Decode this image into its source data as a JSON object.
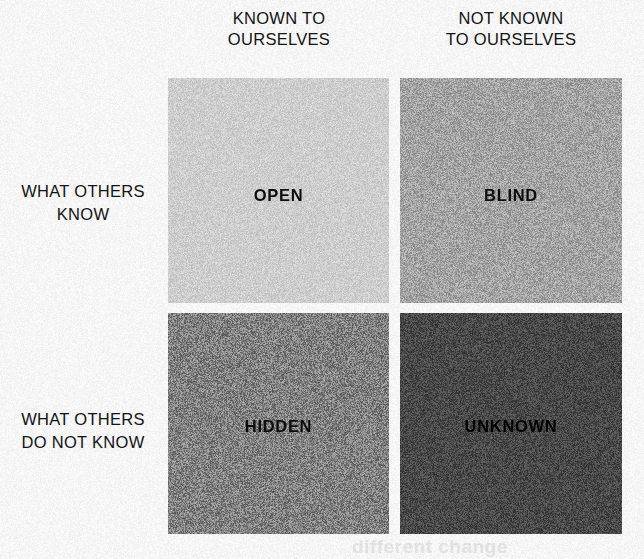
{
  "diagram": {
    "name": "Johari Window",
    "type": "2x2-matrix",
    "background_color": "#fdfdfd",
    "text_color": "#141414"
  },
  "columns": [
    {
      "id": "known-to-ourselves",
      "line1": "KNOWN TO",
      "line2": "OURSELVES"
    },
    {
      "id": "not-known-to-ourselves",
      "line1": "NOT KNOWN",
      "line2": "TO OURSELVES"
    }
  ],
  "rows": [
    {
      "id": "what-others-know",
      "line1": "WHAT OTHERS",
      "line2": "KNOW"
    },
    {
      "id": "what-others-do-not-know",
      "line1": "WHAT OTHERS",
      "line2": "DO NOT KNOW"
    }
  ],
  "quadrants": [
    {
      "id": "open",
      "label": "OPEN",
      "row": "what-others-know",
      "column": "known-to-ourselves",
      "fill": "#d4d4d4",
      "label_color": "#0d0d0d"
    },
    {
      "id": "blind",
      "label": "BLIND",
      "row": "what-others-know",
      "column": "not-known-to-ourselves",
      "fill": "#a8a8a8",
      "label_color": "#0d0d0d"
    },
    {
      "id": "hidden",
      "label": "HIDDEN",
      "row": "what-others-do-not-know",
      "column": "known-to-ourselves",
      "fill": "#848484",
      "label_color": "#0d0d0d"
    },
    {
      "id": "unknown",
      "label": "UNKNOWN",
      "row": "what-others-do-not-know",
      "column": "not-known-to-ourselves",
      "fill": "#4a4a4a",
      "label_color": "#000000"
    }
  ],
  "artifacts": {
    "bleed_through_bottom": "different change"
  }
}
